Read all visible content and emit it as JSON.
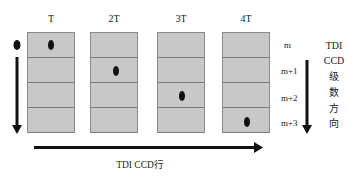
{
  "diagram": {
    "columns": [
      {
        "label": "T",
        "dot_row": 0
      },
      {
        "label": "2T",
        "dot_row": 1
      },
      {
        "label": "3T",
        "dot_row": 2
      },
      {
        "label": "4T",
        "dot_row": 3
      }
    ],
    "row_labels": [
      "m",
      "m+1",
      "m+2",
      "m+3"
    ],
    "side_text": [
      "TDI",
      "CCD",
      "级",
      "数",
      "方",
      "向"
    ],
    "bottom_label": "TDI CCD行",
    "colors": {
      "cell_fill": "#c8c8c8",
      "cell_border": "#7a7a7a",
      "arrow": "#111111",
      "dot": "#111111"
    }
  }
}
